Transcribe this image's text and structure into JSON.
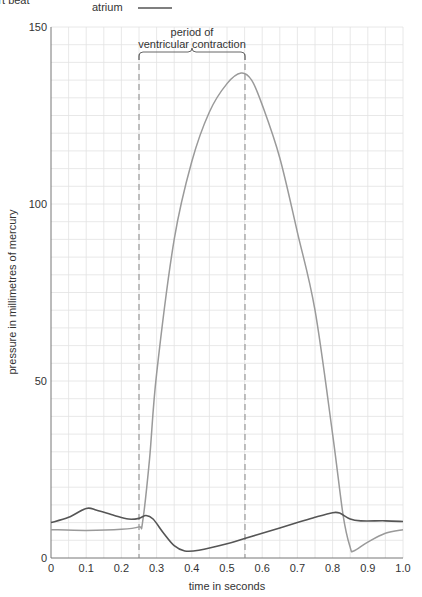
{
  "chart_data": {
    "type": "line",
    "title": "",
    "xlabel": "time in seconds",
    "ylabel": "pressure in millimetres of mercury",
    "xlim": [
      0,
      1.0
    ],
    "ylim": [
      0,
      150
    ],
    "x_ticks": [
      "0",
      "0.1",
      "0.2",
      "0.3",
      "0.4",
      "0.5",
      "0.6",
      "0.7",
      "0.8",
      "0.9",
      "1.0"
    ],
    "y_ticks": [
      "0",
      "50",
      "100",
      "150"
    ],
    "grid": true,
    "legend": {
      "position": "top",
      "entries": [
        {
          "label": "atrium",
          "color": "#555555"
        }
      ]
    },
    "annotations": [
      {
        "text_line1": "period of",
        "text_line2": "ventricular contraction",
        "x_start": 0.25,
        "x_end": 0.55,
        "type": "bracket-with-dashed-lines"
      }
    ],
    "series": [
      {
        "name": "atrium",
        "color": "#555555",
        "points": [
          [
            0,
            10
          ],
          [
            0.05,
            11.5
          ],
          [
            0.1,
            14
          ],
          [
            0.13,
            13.5
          ],
          [
            0.18,
            12
          ],
          [
            0.22,
            11
          ],
          [
            0.25,
            11.2
          ],
          [
            0.27,
            12
          ],
          [
            0.29,
            11
          ],
          [
            0.32,
            7
          ],
          [
            0.35,
            3.5
          ],
          [
            0.38,
            2
          ],
          [
            0.42,
            2.2
          ],
          [
            0.5,
            4
          ],
          [
            0.55,
            5.5
          ],
          [
            0.6,
            7
          ],
          [
            0.65,
            8.5
          ],
          [
            0.7,
            10
          ],
          [
            0.75,
            11.5
          ],
          [
            0.8,
            12.8
          ],
          [
            0.82,
            12.7
          ],
          [
            0.85,
            11
          ],
          [
            0.88,
            10.5
          ],
          [
            0.95,
            10.5
          ],
          [
            1.0,
            10.3
          ]
        ]
      },
      {
        "name": "ventricle",
        "color": "#9a9a9a",
        "points": [
          [
            0,
            8
          ],
          [
            0.1,
            7.8
          ],
          [
            0.2,
            8.1
          ],
          [
            0.25,
            8.8
          ],
          [
            0.26,
            10
          ],
          [
            0.28,
            28
          ],
          [
            0.3,
            52
          ],
          [
            0.35,
            90
          ],
          [
            0.4,
            112
          ],
          [
            0.45,
            126
          ],
          [
            0.5,
            134
          ],
          [
            0.54,
            137
          ],
          [
            0.57,
            135
          ],
          [
            0.6,
            128
          ],
          [
            0.65,
            113
          ],
          [
            0.7,
            92
          ],
          [
            0.75,
            70
          ],
          [
            0.8,
            35
          ],
          [
            0.83,
            12
          ],
          [
            0.85,
            3
          ],
          [
            0.86,
            2
          ],
          [
            0.9,
            4.5
          ],
          [
            0.95,
            7
          ],
          [
            1.0,
            8
          ]
        ]
      }
    ]
  },
  "header": {
    "cutoff_text": "heart beat",
    "legend_label": "atrium"
  },
  "annotation": {
    "line1": "period of",
    "line2": "ventricular contraction"
  },
  "axes": {
    "xlabel": "time in seconds",
    "ylabel": "pressure in millimetres of mercury",
    "x_ticks": [
      "0",
      "0.1",
      "0.2",
      "0.3",
      "0.4",
      "0.5",
      "0.6",
      "0.7",
      "0.8",
      "0.9",
      "1.0"
    ],
    "y_ticks": [
      "0",
      "50",
      "100",
      "150"
    ]
  }
}
